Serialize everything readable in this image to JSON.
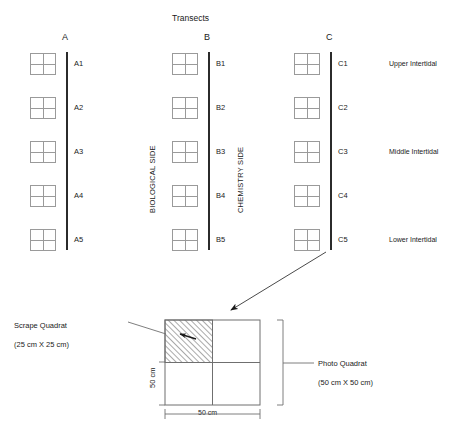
{
  "title": "Transects",
  "transects": [
    {
      "id": "A",
      "label": "A",
      "stations": [
        "A1",
        "A2",
        "A3",
        "A4",
        "A5"
      ]
    },
    {
      "id": "B",
      "label": "B",
      "stations": [
        "B1",
        "B2",
        "B3",
        "B4",
        "B5"
      ]
    },
    {
      "id": "C",
      "label": "C",
      "stations": [
        "C1",
        "C2",
        "C3",
        "C4",
        "C5"
      ]
    }
  ],
  "side_labels": {
    "biological": "BIOLOGICAL SIDE",
    "chemistry": "CHEMISTRY SIDE"
  },
  "zones": [
    {
      "label": "Upper Intertidal"
    },
    {
      "label": "Middle Intertidal"
    },
    {
      "label": "Lower Intertidal"
    }
  ],
  "detail": {
    "scrape": {
      "name": "Scrape Quadrat",
      "size": "(25 cm X 25 cm)"
    },
    "photo": {
      "name": "Photo Quadrat",
      "size": "(50 cm X 50 cm)"
    },
    "dim_height": "50 cm",
    "dim_width": "50 cm"
  },
  "colors": {
    "line": "#2b2b2b",
    "grid": "#9a9a9a",
    "text": "#1a1a1a",
    "hatch": "#555555",
    "background": "#ffffff"
  }
}
